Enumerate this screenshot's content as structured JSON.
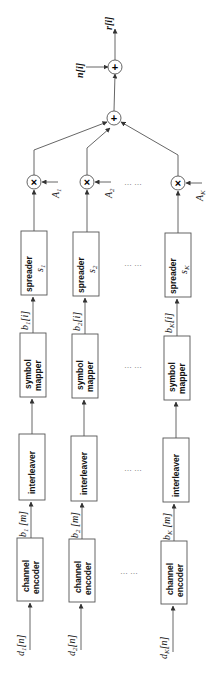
{
  "diagram": {
    "output_label": "r[i]",
    "noise_label": "n[i]",
    "adder_symbol": "+",
    "multiplier_symbol": "×",
    "ellipsis": "… …",
    "branches": [
      {
        "input": "d1[n]",
        "input_base": "d",
        "input_sub": "1",
        "input_idx": "[n]",
        "encoder_line1": "channel",
        "encoder_line2": "encoder",
        "coded": "b1 [m]",
        "coded_base": "b",
        "coded_sub": "1",
        "coded_idx": " [m]",
        "interleaver": "interleaver",
        "mapper_line1": "symbol",
        "mapper_line2": "mapper",
        "symbols": "b1[i]",
        "symbols_base": "b",
        "symbols_sub": "1",
        "symbols_idx": "[i]",
        "spreader": "spreader",
        "code_base": "s",
        "code_sub": "1",
        "amp_base": "A",
        "amp_sub": "1"
      },
      {
        "input": "d2[n]",
        "input_base": "d",
        "input_sub": "2",
        "input_idx": "[n]",
        "encoder_line1": "channel",
        "encoder_line2": "encoder",
        "coded": "b2 [m]",
        "coded_base": "b",
        "coded_sub": "2",
        "coded_idx": " [m]",
        "interleaver": "interleaver",
        "mapper_line1": "symbol",
        "mapper_line2": "mapper",
        "symbols": "b2[i]",
        "symbols_base": "b",
        "symbols_sub": "2",
        "symbols_idx": "[i]",
        "spreader": "spreader",
        "code_base": "s",
        "code_sub": "2",
        "amp_base": "A",
        "amp_sub": "2"
      },
      {
        "input": "dK[n]",
        "input_base": "d",
        "input_sub": "K",
        "input_idx": "[n]",
        "encoder_line1": "channel",
        "encoder_line2": "encoder",
        "coded": "bK [m]",
        "coded_base": "b",
        "coded_sub": "K",
        "coded_idx": " [m]",
        "interleaver": "interleaver",
        "mapper_line1": "symbol",
        "mapper_line2": "mapper",
        "symbols": "bK[i]",
        "symbols_base": "b",
        "symbols_sub": "K",
        "symbols_idx": "[i]",
        "spreader": "spreader",
        "code_base": "s",
        "code_sub": "K",
        "amp_base": "A",
        "amp_sub": "K"
      }
    ]
  }
}
